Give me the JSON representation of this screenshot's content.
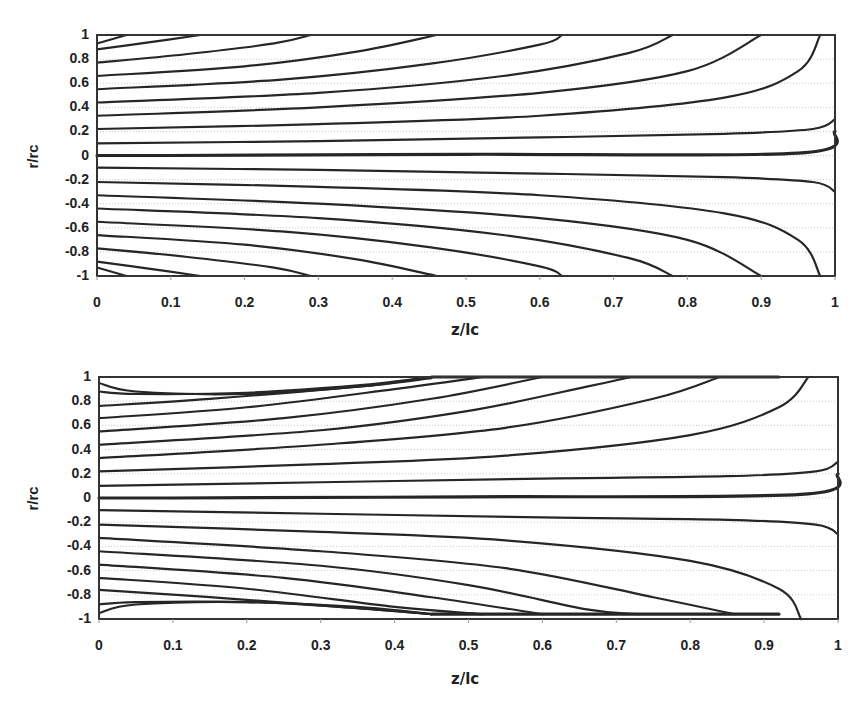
{
  "chart_data": [
    {
      "type": "line",
      "title": "",
      "subtitle": "Streamline contours, case 1",
      "xlabel": "z/lc",
      "ylabel": "r/rc",
      "xlim": [
        0,
        1
      ],
      "ylim": [
        -1,
        1
      ],
      "x_ticks": [
        "0",
        "0.1",
        "0.2",
        "0.3",
        "0.4",
        "0.5",
        "0.6",
        "0.7",
        "0.8",
        "0.9",
        "1"
      ],
      "y_ticks": [
        "1",
        "0.8",
        "0.6",
        "0.4",
        "0.2",
        "0",
        "-0.2",
        "-0.4",
        "-0.6",
        "-0.8",
        "-1"
      ],
      "grid": "horizontal dotted light gray",
      "legend": "none",
      "series": [
        {
          "name": "axis r=0",
          "points": [
            [
              0,
              0
            ],
            [
              0.1,
              0
            ],
            [
              0.5,
              0.01
            ],
            [
              0.95,
              0.02
            ],
            [
              1,
              0.2
            ]
          ]
        },
        {
          "name": "r0=0.1",
          "points": [
            [
              0,
              0.1
            ],
            [
              0.3,
              0.12
            ],
            [
              0.6,
              0.15
            ],
            [
              0.85,
              0.18
            ],
            [
              0.97,
              0.22
            ],
            [
              1,
              0.3
            ]
          ]
        },
        {
          "name": "r0=0.22",
          "points": [
            [
              0,
              0.22
            ],
            [
              0.3,
              0.26
            ],
            [
              0.6,
              0.33
            ],
            [
              0.85,
              0.48
            ],
            [
              0.95,
              0.7
            ],
            [
              0.98,
              1
            ]
          ]
        },
        {
          "name": "r0=0.33",
          "points": [
            [
              0,
              0.33
            ],
            [
              0.3,
              0.4
            ],
            [
              0.6,
              0.52
            ],
            [
              0.8,
              0.7
            ],
            [
              0.9,
              1
            ]
          ]
        },
        {
          "name": "r0=0.44",
          "points": [
            [
              0,
              0.44
            ],
            [
              0.3,
              0.52
            ],
            [
              0.55,
              0.66
            ],
            [
              0.72,
              0.85
            ],
            [
              0.78,
              1
            ]
          ]
        },
        {
          "name": "r0=0.55",
          "points": [
            [
              0,
              0.55
            ],
            [
              0.25,
              0.63
            ],
            [
              0.45,
              0.76
            ],
            [
              0.6,
              0.92
            ],
            [
              0.63,
              1
            ]
          ]
        },
        {
          "name": "r0=0.66",
          "points": [
            [
              0,
              0.66
            ],
            [
              0.2,
              0.74
            ],
            [
              0.35,
              0.86
            ],
            [
              0.46,
              1
            ]
          ]
        },
        {
          "name": "r0=0.77",
          "points": [
            [
              0,
              0.77
            ],
            [
              0.12,
              0.84
            ],
            [
              0.24,
              0.93
            ],
            [
              0.29,
              1
            ]
          ]
        },
        {
          "name": "r0=0.88",
          "points": [
            [
              0,
              0.88
            ],
            [
              0.06,
              0.93
            ],
            [
              0.14,
              1
            ]
          ]
        },
        {
          "name": "r0=0.95",
          "points": [
            [
              0,
              0.93
            ],
            [
              0.04,
              1
            ]
          ]
        },
        {
          "name": "r0=-0.1",
          "points": [
            [
              0,
              -0.1
            ],
            [
              0.3,
              -0.12
            ],
            [
              0.6,
              -0.15
            ],
            [
              0.85,
              -0.18
            ],
            [
              0.97,
              -0.22
            ],
            [
              1,
              -0.3
            ]
          ]
        },
        {
          "name": "r0=-0.22",
          "points": [
            [
              0,
              -0.22
            ],
            [
              0.3,
              -0.26
            ],
            [
              0.6,
              -0.33
            ],
            [
              0.85,
              -0.48
            ],
            [
              0.95,
              -0.7
            ],
            [
              0.98,
              -1
            ]
          ]
        },
        {
          "name": "r0=-0.33",
          "points": [
            [
              0,
              -0.33
            ],
            [
              0.3,
              -0.4
            ],
            [
              0.6,
              -0.52
            ],
            [
              0.8,
              -0.7
            ],
            [
              0.9,
              -1
            ]
          ]
        },
        {
          "name": "r0=-0.44",
          "points": [
            [
              0,
              -0.44
            ],
            [
              0.3,
              -0.52
            ],
            [
              0.55,
              -0.66
            ],
            [
              0.72,
              -0.85
            ],
            [
              0.78,
              -1
            ]
          ]
        },
        {
          "name": "r0=-0.55",
          "points": [
            [
              0,
              -0.55
            ],
            [
              0.25,
              -0.63
            ],
            [
              0.45,
              -0.76
            ],
            [
              0.6,
              -0.92
            ],
            [
              0.63,
              -1
            ]
          ]
        },
        {
          "name": "r0=-0.66",
          "points": [
            [
              0,
              -0.66
            ],
            [
              0.2,
              -0.74
            ],
            [
              0.35,
              -0.86
            ],
            [
              0.46,
              -1
            ]
          ]
        },
        {
          "name": "r0=-0.77",
          "points": [
            [
              0,
              -0.77
            ],
            [
              0.12,
              -0.84
            ],
            [
              0.24,
              -0.93
            ],
            [
              0.29,
              -1
            ]
          ]
        },
        {
          "name": "r0=-0.88",
          "points": [
            [
              0,
              -0.88
            ],
            [
              0.06,
              -0.93
            ],
            [
              0.14,
              -1
            ]
          ]
        },
        {
          "name": "r0=-0.95",
          "points": [
            [
              0,
              -0.93
            ],
            [
              0.04,
              -1
            ]
          ]
        }
      ]
    },
    {
      "type": "line",
      "title": "",
      "subtitle": "Streamline contours, case 2",
      "xlabel": "z/lc",
      "ylabel": "r/rc",
      "xlim": [
        0,
        1
      ],
      "ylim": [
        -1,
        1
      ],
      "x_ticks": [
        "0",
        "0.1",
        "0.2",
        "0.3",
        "0.4",
        "0.5",
        "0.6",
        "0.7",
        "0.8",
        "0.9",
        "1"
      ],
      "y_ticks": [
        "1",
        "0.8",
        "0.6",
        "0.4",
        "0.2",
        "0",
        "-0.2",
        "-0.4",
        "-0.6",
        "-0.8",
        "-1"
      ],
      "grid": "horizontal dotted light gray",
      "legend": "none",
      "series": [
        {
          "name": "axis r=0",
          "points": [
            [
              0,
              0
            ],
            [
              0.1,
              0
            ],
            [
              0.5,
              0.01
            ],
            [
              0.95,
              0.03
            ],
            [
              1,
              0.2
            ]
          ]
        },
        {
          "name": "wall band top",
          "points": [
            [
              0.45,
              1
            ],
            [
              0.92,
              1
            ]
          ]
        },
        {
          "name": "wall band bottom",
          "points": [
            [
              0.45,
              -0.96
            ],
            [
              0.92,
              -0.96
            ]
          ]
        },
        {
          "name": "r0=0.1",
          "points": [
            [
              0,
              0.1
            ],
            [
              0.3,
              0.13
            ],
            [
              0.6,
              0.16
            ],
            [
              0.85,
              0.18
            ],
            [
              0.97,
              0.22
            ],
            [
              1,
              0.3
            ]
          ]
        },
        {
          "name": "r0=0.22",
          "points": [
            [
              0,
              0.22
            ],
            [
              0.3,
              0.28
            ],
            [
              0.55,
              0.35
            ],
            [
              0.8,
              0.52
            ],
            [
              0.92,
              0.75
            ],
            [
              0.96,
              1
            ]
          ]
        },
        {
          "name": "r0=0.33",
          "points": [
            [
              0,
              0.33
            ],
            [
              0.3,
              0.44
            ],
            [
              0.55,
              0.58
            ],
            [
              0.75,
              0.82
            ],
            [
              0.84,
              1
            ]
          ]
        },
        {
          "name": "r0=0.44",
          "points": [
            [
              0,
              0.44
            ],
            [
              0.3,
              0.56
            ],
            [
              0.5,
              0.72
            ],
            [
              0.66,
              0.92
            ],
            [
              0.72,
              1
            ]
          ]
        },
        {
          "name": "r0=0.55",
          "points": [
            [
              0,
              0.55
            ],
            [
              0.25,
              0.66
            ],
            [
              0.45,
              0.82
            ],
            [
              0.6,
              1
            ]
          ]
        },
        {
          "name": "r0=0.66",
          "points": [
            [
              0,
              0.66
            ],
            [
              0.2,
              0.75
            ],
            [
              0.4,
              0.9
            ],
            [
              0.52,
              1
            ]
          ]
        },
        {
          "name": "r0=0.77",
          "points": [
            [
              0,
              0.76
            ],
            [
              0.15,
              0.82
            ],
            [
              0.35,
              0.92
            ],
            [
              0.45,
              1
            ]
          ]
        },
        {
          "name": "r0=0.88",
          "points": [
            [
              0,
              0.88
            ],
            [
              0.05,
              0.86
            ],
            [
              0.2,
              0.87
            ],
            [
              0.35,
              0.93
            ],
            [
              0.45,
              1
            ]
          ]
        },
        {
          "name": "r0=0.95",
          "points": [
            [
              0,
              0.95
            ],
            [
              0.05,
              0.88
            ],
            [
              0.2,
              0.86
            ],
            [
              0.35,
              0.92
            ],
            [
              0.45,
              0.99
            ]
          ]
        },
        {
          "name": "r0=-0.1",
          "points": [
            [
              0,
              -0.1
            ],
            [
              0.3,
              -0.13
            ],
            [
              0.6,
              -0.16
            ],
            [
              0.85,
              -0.18
            ],
            [
              0.97,
              -0.22
            ],
            [
              1,
              -0.3
            ]
          ]
        },
        {
          "name": "r0=-0.22",
          "points": [
            [
              0,
              -0.22
            ],
            [
              0.3,
              -0.28
            ],
            [
              0.55,
              -0.35
            ],
            [
              0.8,
              -0.52
            ],
            [
              0.92,
              -0.75
            ],
            [
              0.95,
              -1
            ]
          ]
        },
        {
          "name": "r0=-0.33",
          "points": [
            [
              0,
              -0.33
            ],
            [
              0.3,
              -0.44
            ],
            [
              0.55,
              -0.58
            ],
            [
              0.75,
              -0.82
            ],
            [
              0.86,
              -0.96
            ]
          ]
        },
        {
          "name": "r0=-0.44",
          "points": [
            [
              0,
              -0.44
            ],
            [
              0.3,
              -0.56
            ],
            [
              0.5,
              -0.72
            ],
            [
              0.66,
              -0.92
            ],
            [
              0.73,
              -0.96
            ]
          ]
        },
        {
          "name": "r0=-0.55",
          "points": [
            [
              0,
              -0.55
            ],
            [
              0.25,
              -0.66
            ],
            [
              0.45,
              -0.82
            ],
            [
              0.6,
              -0.96
            ]
          ]
        },
        {
          "name": "r0=-0.66",
          "points": [
            [
              0,
              -0.66
            ],
            [
              0.2,
              -0.75
            ],
            [
              0.4,
              -0.9
            ],
            [
              0.52,
              -0.96
            ]
          ]
        },
        {
          "name": "r0=-0.77",
          "points": [
            [
              0,
              -0.76
            ],
            [
              0.15,
              -0.82
            ],
            [
              0.35,
              -0.91
            ],
            [
              0.45,
              -0.96
            ]
          ]
        },
        {
          "name": "r0=-0.88",
          "points": [
            [
              0,
              -0.88
            ],
            [
              0.05,
              -0.86
            ],
            [
              0.2,
              -0.86
            ],
            [
              0.35,
              -0.9
            ],
            [
              0.45,
              -0.96
            ]
          ]
        },
        {
          "name": "r0=-0.95",
          "points": [
            [
              0,
              -0.95
            ],
            [
              0.05,
              -0.88
            ],
            [
              0.2,
              -0.86
            ],
            [
              0.35,
              -0.91
            ],
            [
              0.45,
              -0.96
            ]
          ]
        }
      ]
    }
  ],
  "colors": {
    "line": "#262626",
    "frame": "#333333",
    "grid": "#c8c8c8",
    "text": "#222222"
  }
}
